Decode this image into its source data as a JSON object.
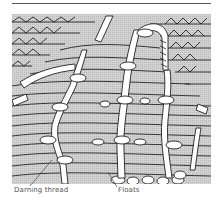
{
  "figure": {
    "labels": [
      {
        "id": "darning",
        "text": "Darning thread"
      },
      {
        "id": "floats",
        "text": "Floats"
      }
    ]
  },
  "colors": {
    "fill": "#c9c9c9",
    "line": "#222222",
    "thread": "#ffffff"
  }
}
